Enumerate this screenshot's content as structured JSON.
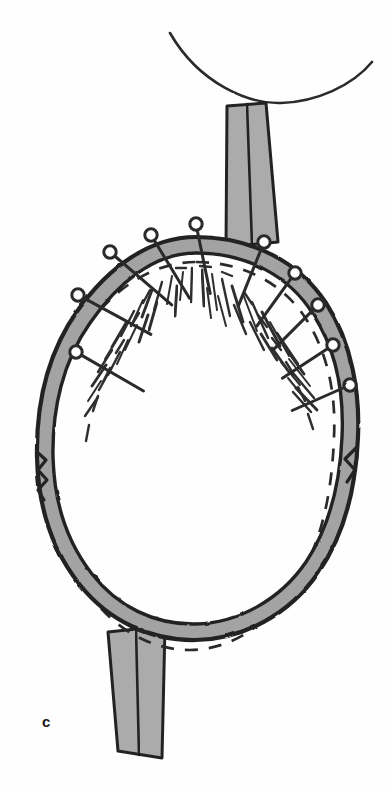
{
  "figure": {
    "panel_label": "c",
    "domain_kind": "scientific-illustration",
    "background_color": "#fefefe"
  },
  "style": {
    "ink_color": "#2b2b2b",
    "ink_color_soft": "#3a3a3a",
    "band_fill": "#a3a3a3",
    "rod_fill_light": "#ababab",
    "rod_fill_dark": "#9a9a9a",
    "dash_color": "#2b2b2b",
    "label_color": "#1a1a1a"
  },
  "elements": {
    "top_suture_label": "top suture thread arc",
    "top_rod_label": "upper shaded rod",
    "bottom_rod_label": "lower shaded rod",
    "ring_label": "annular specimen wall",
    "dashed_outline_label": "dashed reference outline",
    "fiber_hatching_label": "radial fiber hatching",
    "pins_label": "mounting pins"
  },
  "geometry": {
    "canvas": {
      "width": 389,
      "height": 793
    },
    "ring_center": {
      "x": 196,
      "y": 440
    },
    "thread_arc": "M 170 33 C 200 85, 250 104, 281 103 C 316 102, 352 86, 372 62",
    "ring_outer": "M 196 237 C 253 237, 300 263, 326 303 C 352 343, 360 393, 358 437 C 356 487, 345 534, 318 573 C 289 615, 243 639, 196 640 C 150 641, 108 620, 80 585 C 52 550, 38 505, 37 457 C 36 404, 48 352, 78 310 C 108 268, 149 237, 196 237 Z",
    "ring_inner": "M 196 253 C 248 253, 290 277, 313 314 C 337 351, 344 396, 342 437 C 340 483, 330 526, 306 562 C 280 600, 238 623, 196 624 C 154 625, 117 606, 92 574 C 67 542, 54 501, 53 457 C 52 409, 63 361, 90 323 C 117 284, 153 253, 196 253 Z",
    "dashed_outline": "M 196 262 C 244 262, 284 284, 306 319 C 329 355, 336 397, 334 437 C 332 492, 322 543, 296 583 C 269 625, 230 650, 190 650 C 149 650, 112 627, 88 592 C 63 556, 50 508, 50 458 C 49 410, 61 364, 87 327 C 113 289, 153 262, 196 262 Z",
    "top_rod": "M 227 106 L 266 103 L 278 242 L 226 247 Z",
    "top_rod_divider": "M 247 104 L 252 245",
    "bottom_rod": "M 108 632 L 165 626 L 162 758 L 118 751 Z",
    "bottom_rod_divider": "M 136 629 L 139 755",
    "pins": [
      {
        "id": "pin-1",
        "angle": -122,
        "head_x": 76,
        "head_y": 352,
        "tip_x": 121,
        "tip_y": 378
      },
      {
        "id": "pin-2",
        "angle": -108,
        "head_x": 78,
        "head_y": 295,
        "tip_x": 128,
        "tip_y": 322
      },
      {
        "id": "pin-3",
        "angle": -92,
        "head_x": 110,
        "head_y": 252,
        "tip_x": 152,
        "tip_y": 288
      },
      {
        "id": "pin-4",
        "angle": -72,
        "head_x": 151,
        "head_y": 235,
        "tip_x": 176,
        "tip_y": 276
      },
      {
        "id": "pin-5",
        "angle": -52,
        "head_x": 196,
        "head_y": 224,
        "tip_x": 205,
        "tip_y": 268
      },
      {
        "id": "pin-6",
        "angle": -28,
        "head_x": 264,
        "head_y": 242,
        "tip_x": 248,
        "tip_y": 282
      },
      {
        "id": "pin-7",
        "angle": -10,
        "head_x": 295,
        "head_y": 273,
        "tip_x": 272,
        "tip_y": 305
      },
      {
        "id": "pin-8",
        "angle": 8,
        "head_x": 318,
        "head_y": 305,
        "tip_x": 292,
        "tip_y": 331
      },
      {
        "id": "pin-9",
        "angle": 26,
        "head_x": 333,
        "head_y": 345,
        "tip_x": 304,
        "tip_y": 364
      },
      {
        "id": "pin-10",
        "angle": 44,
        "head_x": 350,
        "head_y": 385,
        "tip_x": 316,
        "tip_y": 400
      }
    ],
    "fibers": [
      "M 183 272 L 180 300",
      "M 192 268 L 191 302",
      "M 202 270 L 204 306",
      "M 212 274 L 217 310",
      "M 222 279 L 230 316",
      "M 232 286 L 243 322",
      "M 243 294 L 257 331",
      "M 252 302 L 268 338",
      "M 262 312 L 280 346",
      "M 270 322 L 289 356",
      "M 277 333 L 298 364",
      "M 284 346 L 304 374",
      "M 289 359 L 310 386",
      "M 293 373 L 314 398",
      "M 296 388 L 317 410",
      "M 172 276 L 167 304",
      "M 162 282 L 154 310",
      "M 152 290 L 142 317",
      "M 143 300 L 131 326",
      "M 134 311 L 121 336",
      "M 126 323 L 112 347",
      "M 119 336 L 105 359",
      "M 112 350 L 98 372",
      "M 106 365 L 92 386",
      "M 101 381 L 88 401",
      "M 98 397 L 85 416",
      "M 177 286 L 175 316",
      "M 207 288 L 211 318",
      "M 234 305 L 246 334",
      "M 157 302 L 149 330",
      "M 137 325 L 125 350",
      "M 120 352 L 108 375",
      "M 261 334 L 277 360",
      "M 281 362 L 300 385",
      "M 293 392 L 311 412",
      "M 190 281 L 190 311",
      "M 218 296 L 226 326",
      "M 250 322 L 264 350",
      "M 148 315 L 139 342",
      "M 128 340 L 117 364",
      "M 111 368 L 99 390",
      "M 272 348 L 289 372",
      "M 288 378 L 305 399"
    ],
    "inner_dashes": [
      "M 150 290 L 143 303",
      "M 139 313 L 131 326",
      "M 124 340 L 116 353",
      "M 110 368 L 103 382",
      "M 98 396 L 93 411",
      "M 89 425 L 86 441",
      "M 244 292 L 252 304",
      "M 258 315 L 267 327",
      "M 272 338 L 281 350",
      "M 286 362 L 294 375",
      "M 298 387 L 305 401",
      "M 308 414 L 313 429",
      "M 176 268 L 186 268",
      "M 200 266 L 211 267",
      "M 222 272 L 232 276"
    ],
    "notch_left": "M 37 452 L 46 460 L 38 470 L 47 480 L 38 490 L 44 500",
    "notch_right": "M 356 448 L 345 459 L 355 470 L 347 482"
  }
}
